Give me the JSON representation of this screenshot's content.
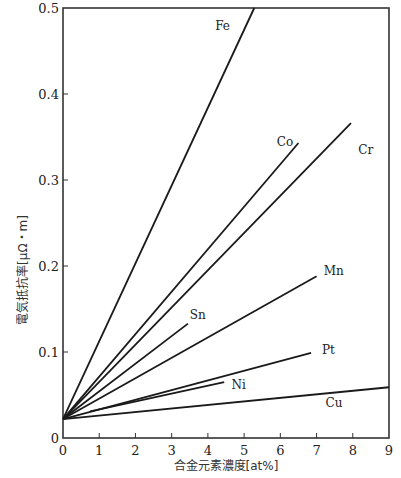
{
  "chart_data": {
    "type": "line",
    "title": "",
    "xlabel": "合金元素濃度[at%]",
    "ylabel": "電気抵抗率[μΩ・m]",
    "xlim": [
      0,
      9
    ],
    "ylim": [
      0,
      0.5
    ],
    "xticks": [
      0,
      1,
      2,
      3,
      4,
      5,
      6,
      7,
      8,
      9
    ],
    "yticks": [
      0,
      0.1,
      0.2,
      0.3,
      0.4,
      0.5
    ],
    "ytick_labels": [
      "0",
      "0.1",
      "0.2",
      "0.3",
      "0.4",
      "0.5"
    ],
    "grid": false,
    "legend": "inline labels at line ends",
    "series": [
      {
        "name": "Fe",
        "x": [
          0,
          5.28
        ],
        "y": [
          0.022,
          0.5
        ],
        "label_pos": [
          4.2,
          0.475
        ]
      },
      {
        "name": "Co",
        "x": [
          0,
          6.5
        ],
        "y": [
          0.022,
          0.343
        ],
        "label_pos": [
          5.9,
          0.34
        ]
      },
      {
        "name": "Cr",
        "x": [
          0,
          7.95
        ],
        "y": [
          0.022,
          0.366
        ],
        "label_pos": [
          8.15,
          0.33
        ]
      },
      {
        "name": "Mn",
        "x": [
          0,
          7.0
        ],
        "y": [
          0.022,
          0.188
        ],
        "label_pos": [
          7.2,
          0.19
        ]
      },
      {
        "name": "Sn",
        "x": [
          0,
          3.45
        ],
        "y": [
          0.022,
          0.133
        ],
        "label_pos": [
          3.5,
          0.138
        ]
      },
      {
        "name": "Pt",
        "x": [
          0,
          6.85
        ],
        "y": [
          0.022,
          0.099
        ],
        "label_pos": [
          7.15,
          0.098
        ]
      },
      {
        "name": "Ni",
        "x": [
          0.75,
          4.45
        ],
        "y": [
          0.031,
          0.065
        ],
        "label_pos": [
          4.65,
          0.057
        ]
      },
      {
        "name": "Cu",
        "x": [
          0,
          9.0
        ],
        "y": [
          0.022,
          0.059
        ],
        "label_pos": [
          7.25,
          0.036
        ]
      }
    ]
  }
}
